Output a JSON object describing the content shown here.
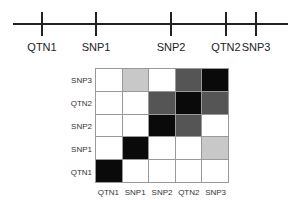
{
  "map": {
    "markers": [
      {
        "label": "QTN1",
        "x": 42
      },
      {
        "label": "SNP1",
        "x": 96
      },
      {
        "label": "SNP2",
        "x": 171
      },
      {
        "label": "QTN2",
        "x": 226
      },
      {
        "label": "SNP3",
        "x": 256
      }
    ]
  },
  "matrix": {
    "row_labels_top_to_bottom": [
      "SNP3",
      "QTN2",
      "SNP2",
      "SNP1",
      "QTN1"
    ],
    "col_labels": [
      "QTN1",
      "SNP1",
      "SNP2",
      "QTN2",
      "SNP3"
    ],
    "cells_top_to_bottom": [
      [
        "#ffffff",
        "#c8c8c8",
        "#ffffff",
        "#555555",
        "#0a0a0a"
      ],
      [
        "#ffffff",
        "#ffffff",
        "#555555",
        "#0a0a0a",
        "#555555"
      ],
      [
        "#ffffff",
        "#ffffff",
        "#0a0a0a",
        "#555555",
        "#ffffff"
      ],
      [
        "#ffffff",
        "#0a0a0a",
        "#ffffff",
        "#ffffff",
        "#c8c8c8"
      ],
      [
        "#0a0a0a",
        "#ffffff",
        "#ffffff",
        "#ffffff",
        "#ffffff"
      ]
    ]
  }
}
